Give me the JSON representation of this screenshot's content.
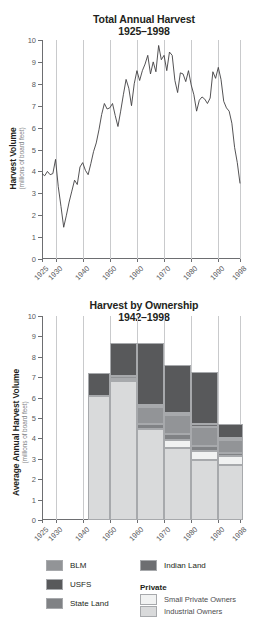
{
  "figure": {
    "background": "#ffffff"
  },
  "colors": {
    "blm": "#929497",
    "usfs": "#58595b",
    "state_land": "#808285",
    "indian_land": "#6d6e71",
    "small_private_owners": "#f1f2f2",
    "industrial_owners": "#d9dadb",
    "line": "#414042",
    "axis": "#6d6e71",
    "grid": "#c9cacc",
    "text": "#231f20"
  },
  "legend": {
    "column_left": [
      {
        "label": "BLM",
        "color_key": "blm"
      },
      {
        "label": "USFS",
        "color_key": "usfs"
      },
      {
        "label": "State Land",
        "color_key": "state_land"
      }
    ],
    "column_right": [
      {
        "label": "Indian Land",
        "color_key": "indian_land"
      }
    ],
    "private_group": {
      "title": "Private",
      "items": [
        {
          "label": "Small Private Owners",
          "color_key": "small_private_owners"
        },
        {
          "label": "Industrial Owners",
          "color_key": "industrial_owners"
        }
      ]
    }
  },
  "chart_data": [
    {
      "id": "total-annual-harvest",
      "type": "line",
      "title": "Total Annual Harvest",
      "subtitle": "1925–1998",
      "xlabel": "",
      "ylabel": "Harvest Volume",
      "ylabel_sub": "(millions of board feet)",
      "ylim": [
        0,
        10
      ],
      "yticks": [
        0,
        1,
        2,
        3,
        4,
        5,
        6,
        7,
        8,
        9,
        10
      ],
      "ytick_labels": [
        "0",
        "1",
        "2",
        "3",
        "4",
        "5",
        "6",
        "7",
        "8",
        "9",
        "10"
      ],
      "xlim": [
        1925,
        1998
      ],
      "xticks": [
        1925,
        1930,
        1940,
        1950,
        1960,
        1970,
        1980,
        1990,
        1998
      ],
      "xtick_labels": [
        "1925",
        "1930",
        "1940",
        "1950",
        "1960",
        "1970",
        "1980",
        "1990",
        "1998"
      ],
      "grid": "vertical",
      "legend": "none",
      "x": [
        1925,
        1926,
        1927,
        1928,
        1929,
        1930,
        1931,
        1932,
        1933,
        1934,
        1935,
        1936,
        1937,
        1938,
        1939,
        1940,
        1941,
        1942,
        1943,
        1944,
        1945,
        1946,
        1947,
        1948,
        1949,
        1950,
        1951,
        1952,
        1953,
        1954,
        1955,
        1956,
        1957,
        1958,
        1959,
        1960,
        1961,
        1962,
        1963,
        1964,
        1965,
        1966,
        1967,
        1968,
        1969,
        1970,
        1971,
        1972,
        1973,
        1974,
        1975,
        1976,
        1977,
        1978,
        1979,
        1980,
        1981,
        1982,
        1983,
        1984,
        1985,
        1986,
        1987,
        1988,
        1989,
        1990,
        1991,
        1992,
        1993,
        1994,
        1995,
        1996,
        1997,
        1998
      ],
      "y": [
        3.9,
        3.8,
        4.0,
        3.85,
        3.9,
        4.55,
        3.3,
        2.4,
        1.45,
        2.0,
        2.6,
        3.1,
        3.6,
        3.4,
        4.2,
        4.4,
        4.05,
        3.85,
        4.35,
        4.9,
        5.3,
        5.9,
        6.6,
        7.1,
        6.85,
        6.9,
        7.1,
        6.55,
        6.05,
        6.75,
        7.5,
        8.2,
        7.8,
        7.0,
        8.0,
        8.6,
        8.15,
        8.6,
        8.9,
        9.3,
        8.45,
        9.0,
        8.55,
        9.75,
        9.1,
        9.3,
        8.6,
        9.45,
        9.3,
        8.15,
        7.6,
        8.5,
        8.45,
        8.1,
        8.6,
        7.95,
        7.5,
        6.75,
        7.25,
        7.4,
        7.3,
        7.1,
        7.35,
        8.55,
        8.25,
        8.75,
        8.2,
        7.2,
        6.9,
        6.75,
        6.2,
        5.1,
        4.4,
        3.45
      ]
    },
    {
      "id": "harvest-by-ownership",
      "type": "bar",
      "stacked": true,
      "title": "Harvest by Ownership",
      "subtitle": "1942–1998",
      "xlabel": "",
      "ylabel": "Average Annual Harvest Volume",
      "ylabel_sub": "(millions of board feet)",
      "ylim": [
        0,
        10
      ],
      "yticks": [
        0,
        1,
        2,
        3,
        4,
        5,
        6,
        7,
        8,
        9,
        10
      ],
      "ytick_labels": [
        "0",
        "1",
        "2",
        "3",
        "4",
        "5",
        "6",
        "7",
        "8",
        "9",
        "10"
      ],
      "xlim": [
        1925,
        1998
      ],
      "xticks": [
        1925,
        1930,
        1940,
        1950,
        1960,
        1970,
        1980,
        1990,
        1998
      ],
      "xtick_labels": [
        "1925",
        "1930",
        "1940",
        "1950",
        "1960",
        "1970",
        "1980",
        "1990",
        "1998"
      ],
      "grid": "vertical",
      "legend": "below",
      "categories": [
        "1942–1949",
        "1950–1959",
        "1960–1969",
        "1970–1979",
        "1980–1989",
        "1990–1998"
      ],
      "bar_spans": [
        [
          1942,
          1949
        ],
        [
          1950,
          1959
        ],
        [
          1960,
          1969
        ],
        [
          1970,
          1979
        ],
        [
          1980,
          1989
        ],
        [
          1990,
          1998
        ]
      ],
      "series": [
        {
          "name": "Industrial Owners",
          "color_key": "industrial_owners",
          "values": [
            6.1,
            6.8,
            4.45,
            3.55,
            2.95,
            2.7
          ]
        },
        {
          "name": "Small Private Owners",
          "color_key": "small_private_owners",
          "values": [
            0.0,
            0.0,
            0.0,
            0.35,
            0.45,
            0.45
          ]
        },
        {
          "name": "State Land",
          "color_key": "state_land",
          "values": [
            0.0,
            0.1,
            0.25,
            0.3,
            0.25,
            0.15
          ]
        },
        {
          "name": "BLM",
          "color_key": "blm",
          "values": [
            0.0,
            0.15,
            0.85,
            0.95,
            0.9,
            0.6
          ]
        },
        {
          "name": "Indian Land",
          "color_key": "indian_land",
          "values": [
            0.0,
            0.0,
            0.1,
            0.1,
            0.15,
            0.1
          ]
        },
        {
          "name": "USFS",
          "color_key": "usfs",
          "values": [
            1.1,
            1.65,
            3.05,
            2.35,
            2.55,
            0.7
          ]
        }
      ],
      "totals": [
        7.2,
        8.7,
        8.7,
        7.6,
        7.25,
        4.7
      ]
    }
  ]
}
